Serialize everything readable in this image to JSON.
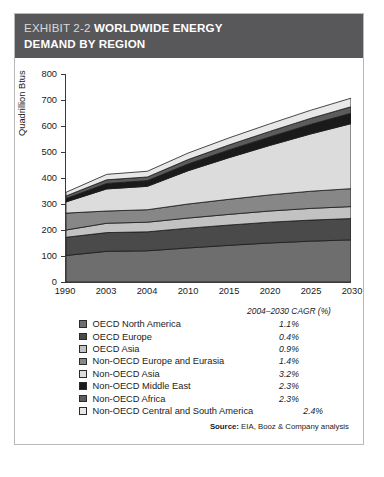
{
  "header": {
    "exhibit_label": "EXHIBIT 2-2",
    "title_line1": "WORLDWIDE ENERGY",
    "title_line2": "DEMAND BY REGION"
  },
  "legend": {
    "cagr_header": "2004–2030 CAGR (%)",
    "source": "Source:",
    "source_text": " EIA, Booz & Company analysis"
  },
  "page_bleed": "",
  "chart_data": {
    "type": "area",
    "stacked": true,
    "title": "Worldwide Energy Demand by Region",
    "xlabel": "",
    "ylabel": "Quadrillion Btus",
    "x": [
      "1990",
      "2003",
      "2004",
      "2010",
      "2015",
      "2020",
      "2025",
      "2030"
    ],
    "ytick_labels": [
      "0",
      "100",
      "200",
      "300",
      "400",
      "500",
      "600",
      "700",
      "800"
    ],
    "ytick_values": [
      0,
      100,
      200,
      300,
      400,
      500,
      600,
      700,
      800
    ],
    "ylim": [
      0,
      800
    ],
    "grid": false,
    "legend_position": "below",
    "series": [
      {
        "name": "OECD North America",
        "cagr": "1.1%",
        "color": "#6e6e6e",
        "values": [
          102,
          118,
          120,
          131,
          141,
          150,
          157,
          162
        ]
      },
      {
        "name": "OECD Europe",
        "cagr": "0.4%",
        "color": "#4a4a4a",
        "values": [
          70,
          72,
          73,
          76,
          78,
          80,
          81,
          82
        ]
      },
      {
        "name": "OECD Asia",
        "cagr": "0.9%",
        "color": "#c2c2c2",
        "values": [
          28,
          36,
          37,
          39,
          41,
          43,
          45,
          46
        ]
      },
      {
        "name": "Non-OECD Europe and Eurasia",
        "cagr": "1.4%",
        "color": "#878787",
        "values": [
          65,
          47,
          48,
          54,
          58,
          62,
          66,
          69
        ]
      },
      {
        "name": "Non-OECD Asia",
        "cagr": "3.2%",
        "color": "#dcdcdc",
        "values": [
          43,
          85,
          90,
          128,
          160,
          190,
          220,
          250
        ]
      },
      {
        "name": "Non-OECD Middle East",
        "cagr": "2.3%",
        "color": "#1a1a1a",
        "values": [
          13,
          21,
          22,
          26,
          30,
          33,
          37,
          40
        ]
      },
      {
        "name": "Non-OECD Africa",
        "cagr": "2.3%",
        "color": "#5c5c5c",
        "values": [
          10,
          14,
          14,
          17,
          19,
          21,
          23,
          25
        ]
      },
      {
        "name": "Non-OECD Central and South America",
        "cagr": "2.4%",
        "color": "#e8e8e8",
        "values": [
          14,
          21,
          22,
          25,
          27,
          29,
          31,
          33
        ]
      }
    ]
  }
}
